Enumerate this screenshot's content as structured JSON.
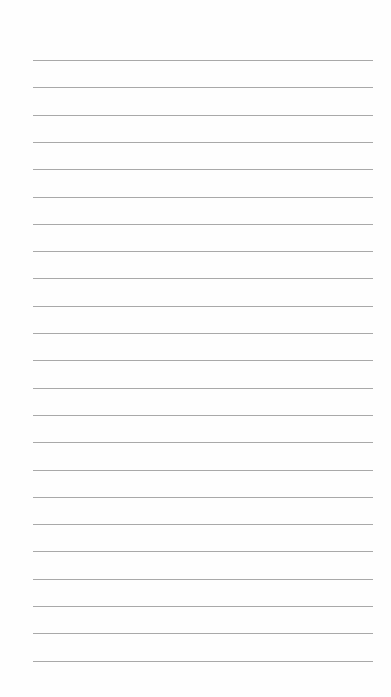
{
  "page": {
    "type": "lined-paper",
    "background": "#fefefe",
    "line_color": "#a9a9a9",
    "line_count": 23,
    "first_line_y": 60,
    "line_spacing": 27.3,
    "line_left": 33,
    "line_width": 340
  }
}
